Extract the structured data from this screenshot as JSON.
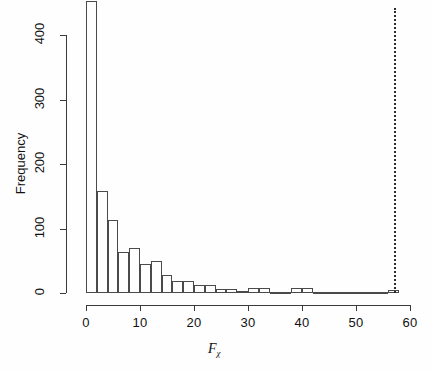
{
  "figure": {
    "background": "#ffffff",
    "foreground": "#1a1a1a",
    "bar_border_color": "#4a4a4a",
    "reference_line_color": "#2b2b2b"
  },
  "axes": {
    "x": {
      "title_main": "F",
      "title_sub": "χ",
      "ticks": [
        0,
        10,
        20,
        30,
        40,
        50,
        60
      ],
      "tick_labels": [
        "0",
        "10",
        "20",
        "30",
        "40",
        "50",
        "60"
      ],
      "range": [
        -1,
        61
      ]
    },
    "y": {
      "title": "Frequency",
      "ticks": [
        0,
        100,
        200,
        300,
        400
      ],
      "tick_labels": [
        "0",
        "100",
        "200",
        "300",
        "400"
      ],
      "range": [
        0,
        455
      ]
    }
  },
  "chart_data": {
    "type": "bar",
    "title": "",
    "xlabel": "Fχ",
    "ylabel": "Frequency",
    "xlim": [
      -1,
      61
    ],
    "ylim": [
      0,
      455
    ],
    "grid": false,
    "legend": null,
    "bin_width": 2,
    "categories": [
      "0-2",
      "2-4",
      "4-6",
      "6-8",
      "8-10",
      "10-12",
      "12-14",
      "14-16",
      "16-18",
      "18-20",
      "20-22",
      "22-24",
      "24-26",
      "26-28",
      "28-30",
      "30-32",
      "32-34",
      "34-36",
      "36-38",
      "38-40",
      "40-42",
      "42-44",
      "44-46",
      "46-48",
      "48-50",
      "50-52",
      "52-54",
      "54-56",
      "56-58"
    ],
    "bin_starts": [
      0,
      2,
      4,
      6,
      8,
      10,
      12,
      14,
      16,
      18,
      20,
      22,
      24,
      26,
      28,
      30,
      32,
      34,
      36,
      38,
      40,
      42,
      44,
      46,
      48,
      50,
      52,
      54,
      56
    ],
    "values": [
      452,
      158,
      113,
      63,
      70,
      45,
      49,
      28,
      18,
      18,
      13,
      13,
      6,
      6,
      3,
      7,
      7,
      2,
      1,
      8,
      8,
      1,
      1,
      1,
      1,
      1,
      1,
      1,
      4
    ],
    "annotations": [
      {
        "kind": "vertical-reference-line",
        "x": 57,
        "style": "dotted",
        "label": ""
      }
    ]
  }
}
